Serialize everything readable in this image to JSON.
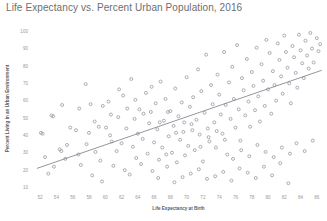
{
  "chart_data": {
    "type": "scatter",
    "title": "Life Expectancy vs. Percent Urban Population, 2016",
    "xlabel": "Life Expectancy at Birth",
    "ylabel": "Percent Living in an Urban Environment",
    "xlim": [
      51,
      87
    ],
    "ylim": [
      8,
      103
    ],
    "xticks": [
      52,
      54,
      56,
      58,
      60,
      62,
      64,
      66,
      68,
      70,
      72,
      74,
      76,
      78,
      80,
      82,
      84,
      86
    ],
    "yticks": [
      10,
      20,
      30,
      40,
      50,
      60,
      70,
      80,
      90,
      100
    ],
    "grid": false,
    "legend": null,
    "marker": {
      "shape": "circle-open",
      "color": "#8d8d96",
      "size": 3
    },
    "trendline": {
      "type": "linear",
      "color": "#7a7a86",
      "x_start": 51.6,
      "y_start": 21.0,
      "x_end": 86.6,
      "y_end": 77.5
    },
    "points": [
      [
        52.1,
        41.5
      ],
      [
        52.3,
        41.0
      ],
      [
        52.6,
        27.5
      ],
      [
        53.0,
        18.0
      ],
      [
        53.4,
        51.5
      ],
      [
        53.6,
        51.0
      ],
      [
        54.4,
        32.0
      ],
      [
        54.6,
        31.0
      ],
      [
        55.1,
        26.5
      ],
      [
        55.3,
        34.5
      ],
      [
        56.4,
        43.0
      ],
      [
        56.8,
        55.5
      ],
      [
        57.0,
        23.0
      ],
      [
        57.6,
        69.5
      ],
      [
        58.0,
        41.5
      ],
      [
        58.2,
        58.0
      ],
      [
        58.4,
        17.0
      ],
      [
        58.8,
        30.5
      ],
      [
        59.2,
        45.0
      ],
      [
        59.4,
        25.5
      ],
      [
        59.6,
        13.5
      ],
      [
        60.1,
        44.5
      ],
      [
        60.4,
        59.5
      ],
      [
        60.6,
        40.0
      ],
      [
        60.8,
        36.5
      ],
      [
        61.0,
        22.5
      ],
      [
        61.4,
        31.0
      ],
      [
        61.6,
        50.5
      ],
      [
        62.0,
        35.5
      ],
      [
        62.2,
        63.0
      ],
      [
        62.4,
        20.0
      ],
      [
        62.6,
        44.0
      ],
      [
        63.0,
        17.5
      ],
      [
        63.2,
        72.5
      ],
      [
        63.4,
        33.5
      ],
      [
        63.6,
        49.5
      ],
      [
        63.8,
        27.0
      ],
      [
        64.0,
        41.0
      ],
      [
        64.2,
        55.0
      ],
      [
        64.4,
        23.5
      ],
      [
        64.6,
        38.0
      ],
      [
        65.0,
        64.5
      ],
      [
        65.2,
        29.5
      ],
      [
        65.4,
        47.0
      ],
      [
        65.6,
        53.5
      ],
      [
        65.8,
        19.5
      ],
      [
        66.0,
        36.0
      ],
      [
        66.2,
        58.5
      ],
      [
        66.4,
        43.5
      ],
      [
        66.6,
        26.0
      ],
      [
        66.8,
        71.0
      ],
      [
        67.0,
        33.0
      ],
      [
        67.2,
        48.5
      ],
      [
        67.4,
        61.0
      ],
      [
        67.6,
        22.0
      ],
      [
        67.8,
        39.5
      ],
      [
        68.0,
        54.0
      ],
      [
        68.2,
        30.0
      ],
      [
        68.4,
        45.5
      ],
      [
        68.6,
        67.0
      ],
      [
        68.8,
        24.5
      ],
      [
        69.0,
        51.0
      ],
      [
        69.2,
        37.5
      ],
      [
        69.4,
        59.0
      ],
      [
        69.6,
        42.0
      ],
      [
        69.8,
        28.5
      ],
      [
        70.0,
        73.5
      ],
      [
        70.2,
        34.0
      ],
      [
        70.4,
        56.5
      ],
      [
        70.6,
        46.5
      ],
      [
        70.8,
        62.0
      ],
      [
        71.0,
        31.5
      ],
      [
        71.2,
        49.0
      ],
      [
        71.4,
        78.0
      ],
      [
        71.6,
        40.5
      ],
      [
        71.8,
        65.5
      ],
      [
        72.0,
        25.0
      ],
      [
        72.2,
        53.0
      ],
      [
        72.4,
        86.5
      ],
      [
        72.6,
        44.0
      ],
      [
        72.8,
        36.5
      ],
      [
        73.0,
        69.0
      ],
      [
        73.2,
        58.0
      ],
      [
        73.4,
        47.5
      ],
      [
        73.6,
        33.0
      ],
      [
        73.8,
        75.0
      ],
      [
        74.0,
        63.5
      ],
      [
        74.2,
        52.0
      ],
      [
        74.4,
        41.0
      ],
      [
        74.6,
        88.0
      ],
      [
        74.8,
        57.5
      ],
      [
        75.0,
        29.0
      ],
      [
        75.2,
        70.5
      ],
      [
        75.4,
        49.5
      ],
      [
        75.6,
        79.5
      ],
      [
        75.8,
        61.0
      ],
      [
        76.0,
        44.5
      ],
      [
        76.2,
        92.0
      ],
      [
        76.4,
        55.0
      ],
      [
        76.6,
        37.0
      ],
      [
        76.8,
        73.0
      ],
      [
        77.0,
        66.0
      ],
      [
        77.2,
        51.5
      ],
      [
        77.4,
        84.0
      ],
      [
        77.6,
        59.5
      ],
      [
        77.8,
        45.0
      ],
      [
        78.0,
        76.5
      ],
      [
        78.2,
        68.5
      ],
      [
        78.4,
        54.5
      ],
      [
        78.6,
        90.5
      ],
      [
        78.8,
        62.5
      ],
      [
        79.0,
        48.0
      ],
      [
        79.2,
        81.0
      ],
      [
        79.4,
        71.5
      ],
      [
        79.6,
        57.0
      ],
      [
        79.8,
        95.0
      ],
      [
        80.0,
        66.5
      ],
      [
        80.2,
        87.5
      ],
      [
        80.4,
        52.5
      ],
      [
        80.6,
        77.0
      ],
      [
        80.8,
        69.0
      ],
      [
        81.0,
        60.0
      ],
      [
        81.2,
        93.0
      ],
      [
        81.4,
        83.5
      ],
      [
        81.6,
        74.0
      ],
      [
        81.8,
        64.0
      ],
      [
        82.0,
        97.5
      ],
      [
        82.2,
        88.0
      ],
      [
        82.4,
        79.0
      ],
      [
        82.6,
        70.0
      ],
      [
        82.8,
        58.5
      ],
      [
        83.0,
        91.5
      ],
      [
        83.2,
        85.0
      ],
      [
        83.4,
        76.0
      ],
      [
        83.6,
        67.5
      ],
      [
        83.8,
        98.0
      ],
      [
        84.0,
        89.0
      ],
      [
        84.2,
        81.5
      ],
      [
        84.4,
        73.0
      ],
      [
        84.6,
        94.5
      ],
      [
        84.8,
        86.0
      ],
      [
        85.0,
        78.5
      ],
      [
        85.2,
        99.0
      ],
      [
        85.4,
        90.0
      ],
      [
        85.6,
        82.0
      ],
      [
        86.0,
        96.0
      ],
      [
        86.2,
        88.5
      ],
      [
        86.4,
        92.5
      ],
      [
        73.5,
        16.5
      ],
      [
        74.5,
        19.0
      ],
      [
        75.5,
        14.0
      ],
      [
        76.5,
        21.0
      ],
      [
        77.5,
        18.5
      ],
      [
        78.5,
        15.5
      ],
      [
        79.5,
        22.0
      ],
      [
        80.5,
        17.0
      ],
      [
        81.5,
        24.0
      ],
      [
        82.5,
        12.5
      ],
      [
        71.5,
        20.5
      ],
      [
        72.5,
        15.0
      ],
      [
        70.5,
        18.0
      ],
      [
        69.5,
        16.0
      ],
      [
        68.5,
        13.0
      ],
      [
        67.5,
        29.0
      ],
      [
        66.5,
        15.5
      ],
      [
        75.7,
        26.5
      ],
      [
        76.7,
        31.5
      ],
      [
        77.7,
        28.0
      ],
      [
        78.7,
        34.5
      ],
      [
        79.7,
        30.5
      ],
      [
        80.7,
        27.5
      ],
      [
        81.7,
        33.0
      ],
      [
        82.7,
        29.5
      ],
      [
        83.5,
        35.5
      ],
      [
        84.5,
        31.0
      ],
      [
        85.5,
        37.0
      ],
      [
        74.7,
        37.5
      ],
      [
        73.7,
        42.5
      ],
      [
        72.7,
        39.0
      ],
      [
        71.7,
        33.5
      ],
      [
        70.7,
        43.0
      ],
      [
        69.7,
        47.5
      ],
      [
        68.7,
        41.5
      ],
      [
        67.7,
        53.5
      ],
      [
        66.7,
        47.5
      ],
      [
        65.7,
        68.0
      ],
      [
        64.7,
        52.5
      ],
      [
        63.7,
        60.5
      ],
      [
        62.7,
        55.5
      ],
      [
        61.7,
        66.5
      ],
      [
        60.7,
        52.0
      ],
      [
        59.7,
        57.0
      ],
      [
        58.7,
        48.0
      ],
      [
        57.7,
        35.0
      ],
      [
        56.7,
        29.0
      ],
      [
        55.7,
        44.5
      ],
      [
        54.7,
        57.5
      ],
      [
        53.7,
        22.0
      ]
    ]
  }
}
